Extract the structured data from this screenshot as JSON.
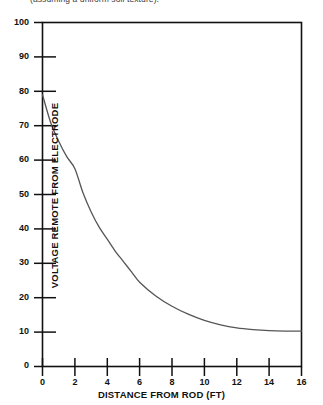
{
  "caption": {
    "text": "(assuming a uniform soil texture)."
  },
  "chart_data": {
    "type": "line",
    "title": "",
    "subtitle": "(assuming a uniform soil texture).",
    "xlabel": "DISTANCE FROM ROD (FT)",
    "ylabel": "VOLTAGE REMOTE FROM ELECTRODE",
    "xlim": [
      0,
      16
    ],
    "ylim": [
      0,
      100
    ],
    "xticks": [
      0,
      2,
      4,
      6,
      8,
      10,
      12,
      14,
      16
    ],
    "yticks": [
      0,
      10,
      20,
      30,
      40,
      50,
      60,
      70,
      80,
      90,
      100
    ],
    "grid": false,
    "legend": null,
    "line_color": "#555555",
    "axis_color": "#111111",
    "background": "#ffffff",
    "series": [
      {
        "name": "Voltage remote from electrode",
        "x": [
          0,
          0.5,
          1,
          1.5,
          2,
          2.5,
          3,
          3.5,
          4,
          4.5,
          5,
          5.5,
          6,
          7,
          8,
          9,
          10,
          11,
          12,
          13,
          14,
          15,
          16
        ],
        "values": [
          79,
          71,
          65.5,
          61,
          57.5,
          50.5,
          45,
          40.5,
          37,
          33.5,
          30.5,
          27.5,
          24.5,
          20.5,
          17.5,
          15.2,
          13.4,
          12.1,
          11.2,
          10.7,
          10.4,
          10.3,
          10.3
        ]
      }
    ]
  },
  "axes": {
    "y_tick_labels": [
      "100",
      "90",
      "80",
      "70",
      "60",
      "50",
      "40",
      "30",
      "20",
      "10",
      "0"
    ],
    "x_tick_labels": [
      "0",
      "2",
      "4",
      "6",
      "8",
      "10",
      "12",
      "14",
      "16"
    ]
  }
}
